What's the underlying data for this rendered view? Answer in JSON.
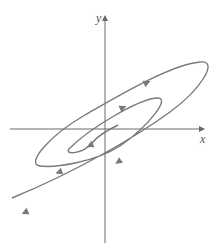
{
  "figure": {
    "type": "phase-portrait",
    "axes": {
      "x_label": "x",
      "y_label": "y"
    },
    "colors": {
      "curve": "#7a7a7a",
      "axis": "#6a6a6a",
      "background": "#ffffff"
    },
    "arrow_count": 6
  }
}
